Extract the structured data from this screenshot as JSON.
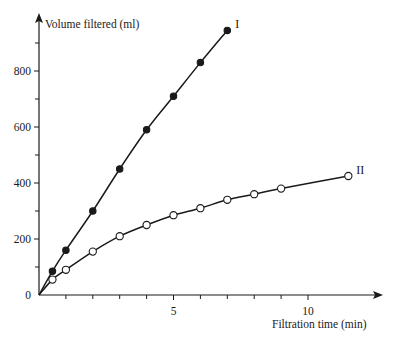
{
  "chart_data": {
    "type": "line",
    "title": "",
    "xlabel": "Filtration time (min)",
    "ylabel": "Volume filtered (ml)",
    "xlim": [
      0,
      13
    ],
    "ylim": [
      0,
      1050
    ],
    "x_ticks": [
      5,
      10
    ],
    "x_minor_ticks": [
      1,
      2,
      3,
      4,
      6,
      7,
      8,
      9
    ],
    "y_ticks": [
      0,
      200,
      400,
      600,
      800
    ],
    "y_minor_ticks": [
      100,
      300,
      500,
      700,
      900
    ],
    "grid": false,
    "legend": "inline labels at line ends",
    "series": [
      {
        "name": "I",
        "marker": "filled-circle",
        "x": [
          0,
          0.5,
          1,
          2,
          3,
          4,
          5,
          6,
          7
        ],
        "values": [
          0,
          85,
          160,
          300,
          450,
          590,
          710,
          830,
          945
        ]
      },
      {
        "name": "II",
        "marker": "open-circle",
        "x": [
          0,
          0.5,
          1,
          2,
          3,
          4,
          5,
          6,
          7,
          8,
          9,
          11.5
        ],
        "values": [
          0,
          55,
          90,
          155,
          210,
          250,
          285,
          310,
          340,
          360,
          380,
          425
        ]
      }
    ]
  },
  "colors": {
    "ink": "#1a1a1a",
    "background": "#ffffff"
  }
}
